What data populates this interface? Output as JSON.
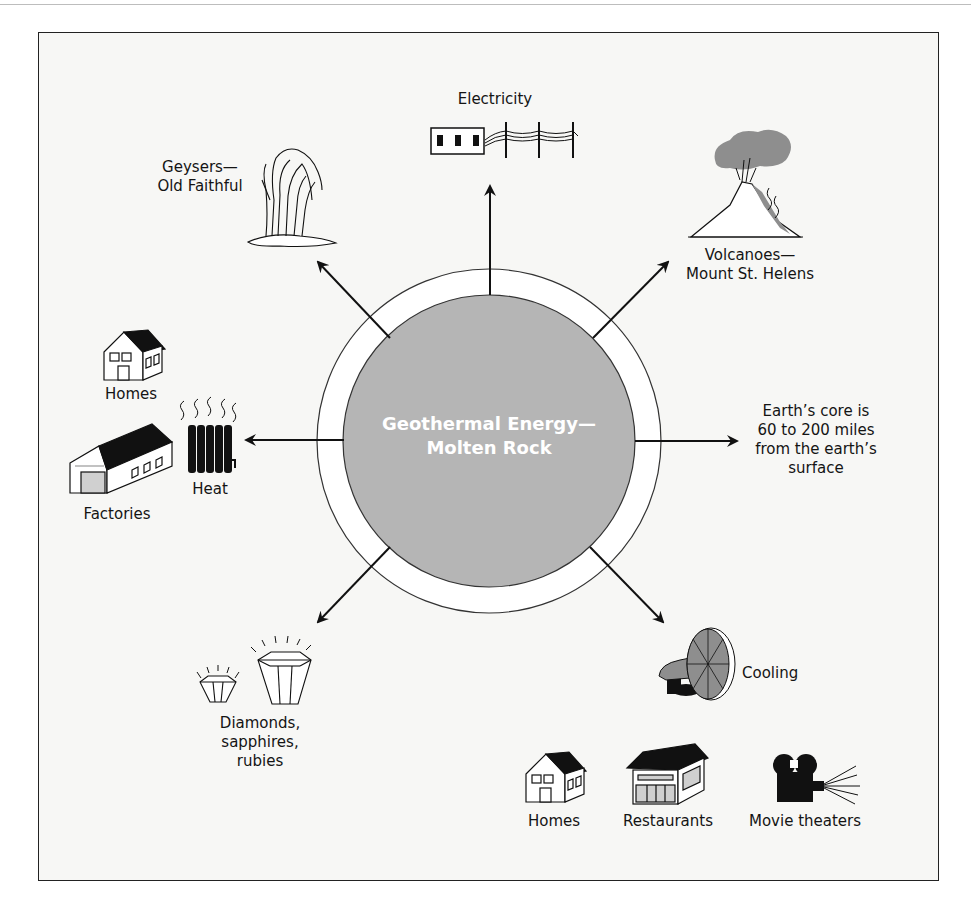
{
  "diagram": {
    "center": {
      "line1": "Geothermal Energy—",
      "line2": "Molten Rock",
      "fill": "#b5b5b5"
    },
    "nodes": {
      "electricity": {
        "label": "Electricity",
        "icon": "power-line-icon"
      },
      "geysers": {
        "line1": "Geysers—",
        "line2": "Old Faithful",
        "icon": "geyser-icon"
      },
      "volcanoes": {
        "line1": "Volcanoes—",
        "line2": "Mount St. Helens",
        "icon": "volcano-icon"
      },
      "heat": {
        "label": "Heat",
        "icon": "radiator-icon",
        "uses": [
          {
            "label": "Homes",
            "icon": "house-icon"
          },
          {
            "label": "Factories",
            "icon": "factory-icon"
          }
        ]
      },
      "core": {
        "lines": [
          "Earth’s core is",
          "60 to 200 miles",
          "from the earth’s",
          "surface"
        ]
      },
      "gems": {
        "lines": [
          "Diamonds,",
          "sapphires,",
          "rubies"
        ],
        "icon": "gem-icon"
      },
      "cooling": {
        "label": "Cooling",
        "icon": "fan-icon",
        "uses": [
          {
            "label": "Homes",
            "icon": "house-icon"
          },
          {
            "label": "Restaurants",
            "icon": "restaurant-icon"
          },
          {
            "label": "Movie theaters",
            "icon": "movie-camera-icon"
          }
        ]
      }
    }
  }
}
